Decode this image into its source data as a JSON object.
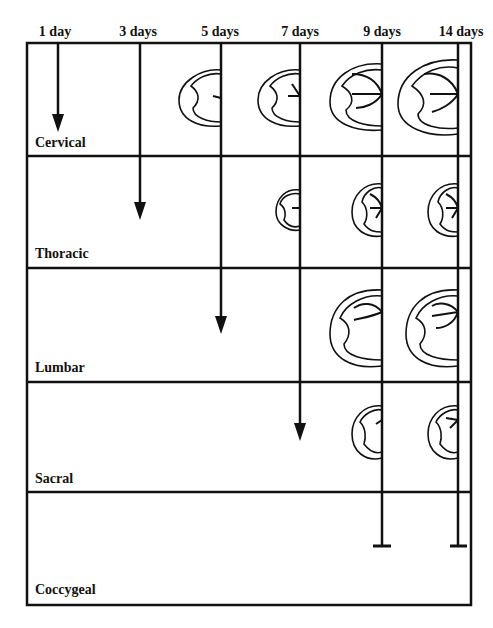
{
  "diagram": {
    "type": "timeline-grid",
    "columns": [
      {
        "label": "1 day",
        "x": 58,
        "label_x": 55
      },
      {
        "label": "3 days",
        "x": 140,
        "label_x": 138
      },
      {
        "label": "5 days",
        "x": 221,
        "label_x": 220
      },
      {
        "label": "7 days",
        "x": 300,
        "label_x": 300
      },
      {
        "label": "9 days",
        "x": 382,
        "label_x": 382
      },
      {
        "label": "14 days",
        "x": 458,
        "label_x": 461
      }
    ],
    "rows": [
      {
        "label": "Cervical",
        "label_y": 135
      },
      {
        "label": "Thoracic",
        "label_y": 246
      },
      {
        "label": "Lumbar",
        "label_y": 360
      },
      {
        "label": "Sacral",
        "label_y": 471
      },
      {
        "label": "Coccygeal",
        "label_y": 582
      }
    ],
    "progression_lines": [
      {
        "column": "1 day",
        "ends_in": "Cervical",
        "end": "arrow"
      },
      {
        "column": "3 days",
        "ends_in": "Thoracic",
        "end": "arrow"
      },
      {
        "column": "5 days",
        "ends_in": "Lumbar",
        "end": "arrow"
      },
      {
        "column": "7 days",
        "ends_in": "Sacral",
        "end": "arrow"
      },
      {
        "column": "9 days",
        "ends_in": "Coccygeal",
        "end": "bar"
      },
      {
        "column": "14 days",
        "ends_in": "Coccygeal",
        "end": "bar"
      }
    ],
    "cross_sections": [
      {
        "row": "Cervical",
        "column": "5 days",
        "size": "medium",
        "arrows": 1
      },
      {
        "row": "Cervical",
        "column": "7 days",
        "size": "medium",
        "arrows": 2
      },
      {
        "row": "Cervical",
        "column": "9 days",
        "size": "large",
        "arrows": 3
      },
      {
        "row": "Cervical",
        "column": "14 days",
        "size": "large",
        "arrows": 3
      },
      {
        "row": "Thoracic",
        "column": "7 days",
        "size": "small",
        "arrows": 1
      },
      {
        "row": "Thoracic",
        "column": "9 days",
        "size": "small",
        "arrows": 3
      },
      {
        "row": "Thoracic",
        "column": "14 days",
        "size": "small",
        "arrows": 3
      },
      {
        "row": "Lumbar",
        "column": "9 days",
        "size": "large",
        "arrows": 2
      },
      {
        "row": "Lumbar",
        "column": "14 days",
        "size": "large",
        "arrows": 3
      },
      {
        "row": "Sacral",
        "column": "9 days",
        "size": "small",
        "arrows": 1
      },
      {
        "row": "Sacral",
        "column": "14 days",
        "size": "small",
        "arrows": 2
      }
    ],
    "colors": {
      "line": "#111111",
      "background": "#ffffff"
    }
  }
}
